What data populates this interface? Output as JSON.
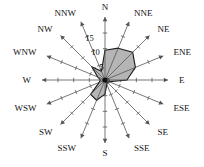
{
  "chart_data": {
    "type": "line",
    "subtype": "wind-rose-radar",
    "title": "",
    "xlabel": "",
    "ylabel": "",
    "grid": false,
    "legend": "none",
    "radial_axis": {
      "ticks": [
        0,
        5,
        10,
        15
      ],
      "tick_labels": [
        "0",
        "5",
        "10",
        "15"
      ],
      "range": [
        0,
        15
      ],
      "label_direction": "NNW"
    },
    "categories": [
      "N",
      "NNE",
      "NE",
      "ENE",
      "E",
      "ESE",
      "SE",
      "SSE",
      "S",
      "SSW",
      "SW",
      "WSW",
      "W",
      "WNW",
      "NW",
      "NNW"
    ],
    "values": [
      9.5,
      11.0,
      12.5,
      10.5,
      7.0,
      1.5,
      1.0,
      1.5,
      4.5,
      7.0,
      6.5,
      2.0,
      1.5,
      2.5,
      6.0,
      3.0
    ],
    "series": [
      {
        "name": "Wind frequency",
        "values": [
          9.5,
          11.0,
          12.5,
          10.5,
          7.0,
          1.5,
          1.0,
          1.5,
          4.5,
          7.0,
          6.5,
          2.0,
          1.5,
          2.5,
          6.0,
          3.0
        ]
      }
    ],
    "colors": {
      "fill": "#b5b5b5",
      "stroke": "#1a1a1a",
      "axis": "#555555",
      "text": "#111111",
      "background": "#ffffff"
    }
  },
  "labels": {
    "directions": [
      {
        "name": "N",
        "text": "N"
      },
      {
        "name": "NNE",
        "text": "NNE"
      },
      {
        "name": "NE",
        "text": "NE"
      },
      {
        "name": "ENE",
        "text": "ENE"
      },
      {
        "name": "E",
        "text": "E"
      },
      {
        "name": "ESE",
        "text": "ESE"
      },
      {
        "name": "SE",
        "text": "SE"
      },
      {
        "name": "SSE",
        "text": "SSE"
      },
      {
        "name": "S",
        "text": "S"
      },
      {
        "name": "SSW",
        "text": "SSW"
      },
      {
        "name": "SW",
        "text": "SW"
      },
      {
        "name": "WSW",
        "text": "WSW"
      },
      {
        "name": "W",
        "text": "W"
      },
      {
        "name": "WNW",
        "text": "WNW"
      },
      {
        "name": "NW",
        "text": "NW"
      },
      {
        "name": "NNW",
        "text": "NNW"
      }
    ],
    "scale": [
      "0",
      "5",
      "10",
      "15"
    ]
  }
}
